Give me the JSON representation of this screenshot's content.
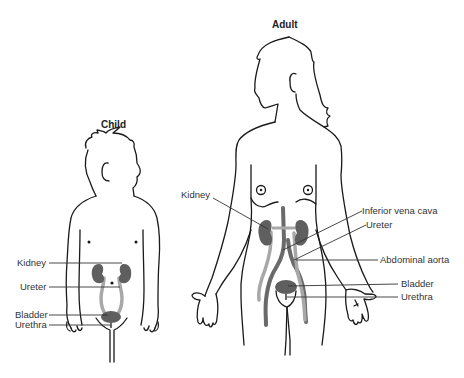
{
  "figures": [
    {
      "id": "child",
      "title": "Child",
      "labels": [
        {
          "key": "kidney",
          "text": "Kidney"
        },
        {
          "key": "ureter",
          "text": "Ureter"
        },
        {
          "key": "bladder",
          "text": "Bladder"
        },
        {
          "key": "urethra",
          "text": "Urethra"
        }
      ]
    },
    {
      "id": "adult",
      "title": "Adult",
      "labels": [
        {
          "key": "kidney",
          "text": "Kidney"
        },
        {
          "key": "inferior_vena_cava",
          "text": "Inferior vena cava"
        },
        {
          "key": "ureter",
          "text": "Ureter"
        },
        {
          "key": "abdominal_aorta",
          "text": "Abdominal aorta"
        },
        {
          "key": "bladder",
          "text": "Bladder"
        },
        {
          "key": "urethra",
          "text": "Urethra"
        }
      ]
    }
  ],
  "colors": {
    "organ": "#5f5f5f",
    "ureter_light": "#a8a8a8",
    "vessel_dark": "#6a6a6a",
    "outline": "#1a1a1a",
    "text": "#333333"
  }
}
